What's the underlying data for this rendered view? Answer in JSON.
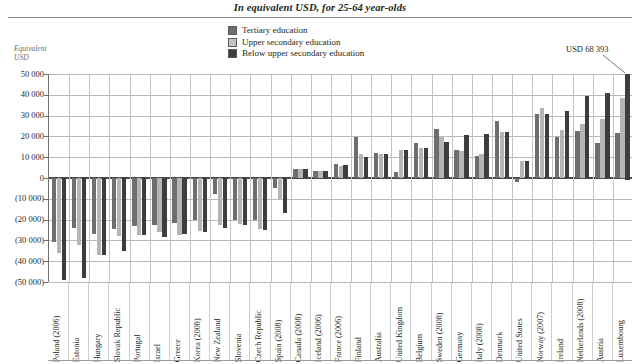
{
  "chart_data": {
    "type": "bar",
    "title": "In equivalent USD, for 25-64 year-olds",
    "xlabel": "",
    "ylabel": "Equivalent USD",
    "ylim": [
      -50000,
      50000
    ],
    "ytick_labels": [
      "50 000",
      "40 000",
      "30 000",
      "20 000",
      "10 000",
      "0",
      "(10 000)",
      "(20 000)",
      "(30 000)",
      "(40 000)",
      "(50 000)"
    ],
    "ytick_values": [
      50000,
      40000,
      30000,
      20000,
      10000,
      0,
      -10000,
      -20000,
      -30000,
      -40000,
      -50000
    ],
    "grid": true,
    "legend_position": "top-center",
    "categories": [
      "Poland (2006)",
      "Estonia",
      "Hungary",
      "Slovak Republic",
      "Portugal",
      "Israel",
      "Greece",
      "Korea (2008)",
      "New Zealand",
      "Slovenia",
      "Czech Republic",
      "Spain (2008)",
      "Canada (2008)",
      "Iceland (2006)",
      "France (2006)",
      "Finland",
      "Australia",
      "United Kingdom",
      "Belgium",
      "Sweden (2008)",
      "Germany",
      "Italy (2008)",
      "Denmark",
      "United States",
      "Norway (2007)",
      "Ireland",
      "Netherlands (2008)",
      "Austria",
      "Luxembourg"
    ],
    "series": [
      {
        "name": "Tertiary education",
        "color": "#6e6e6e",
        "values": [
          -31000,
          -24000,
          -27000,
          -24500,
          -23000,
          -22500,
          -21500,
          -20000,
          -7500,
          -20000,
          -20000,
          -5000,
          4300,
          3500,
          6500,
          19500,
          11800,
          2700,
          16800,
          23700,
          13400,
          10800,
          27500,
          -2000,
          31000,
          19600,
          22700,
          16700,
          21700
        ]
      },
      {
        "name": "Upper secondary education",
        "color": "#b5b5b5",
        "values": [
          -36000,
          -32000,
          -37000,
          -28000,
          -27500,
          -26000,
          -27500,
          -25500,
          -22500,
          -22000,
          -24500,
          -10000,
          4400,
          3400,
          5700,
          11500,
          11500,
          13700,
          14500,
          19500,
          13000,
          11500,
          22000,
          8200,
          33800,
          23200,
          26000,
          28200,
          38300
        ]
      },
      {
        "name": "Below upper secondary education",
        "color": "#3d3d3d",
        "values": [
          -49000,
          -48000,
          -36800,
          -35000,
          -27300,
          -28200,
          -27000,
          -26000,
          -24200,
          -22500,
          -24800,
          -17000,
          4300,
          3400,
          6300,
          10100,
          11300,
          13500,
          14300,
          17200,
          20500,
          21000,
          21900,
          8200,
          30800,
          32200,
          39600,
          40800,
          51000
        ]
      }
    ],
    "annotation": {
      "text": "USD 68 393",
      "points_to": "Luxembourg below-upper-secondary bar"
    }
  },
  "legend": {
    "items": [
      {
        "label": "Tertiary education",
        "color": "#6e6e6e"
      },
      {
        "label": "Upper secondary education",
        "color": "#b5b5b5"
      },
      {
        "label": "Below upper secondary education",
        "color": "#3d3d3d"
      }
    ]
  },
  "axis": {
    "ylabel_line1": "Equivalent",
    "ylabel_line2": "USD"
  }
}
